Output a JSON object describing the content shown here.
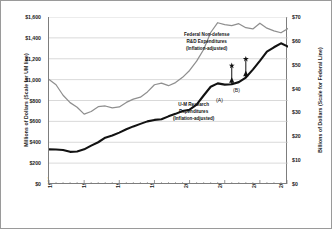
{
  "chart_data": {
    "type": "line",
    "title": "",
    "xlabel": "",
    "ylabel": "Millions of Dollars (Scale for UM line)",
    "ylabel_right": "Billions of Dollars (Scale for Federal Line)",
    "grid": true,
    "legend_position": "inline-annotation",
    "xlim": [
      1980,
      2014
    ],
    "ylim": [
      0,
      1600
    ],
    "ylim_right": [
      0,
      70
    ],
    "x_ticks": [
      "1980",
      "1985",
      "1990",
      "1995",
      "2000",
      "2005",
      "2010",
      "2014"
    ],
    "x_tick_values": [
      1980,
      1985,
      1990,
      1995,
      2000,
      2005,
      2010,
      2014
    ],
    "y_ticks_left": [
      "$0",
      "$200",
      "$400",
      "$600",
      "$800",
      "$1,000",
      "$1,200",
      "$1,400",
      "$1,600"
    ],
    "y_tick_values_left": [
      0,
      200,
      400,
      600,
      800,
      1000,
      1200,
      1400,
      1600
    ],
    "y_ticks_right": [
      "$0",
      "$10",
      "$20",
      "$30",
      "$40",
      "$50",
      "$60",
      "$70"
    ],
    "y_tick_values_right": [
      0,
      10,
      20,
      30,
      40,
      50,
      60,
      70
    ],
    "x": [
      1980,
      1981,
      1982,
      1983,
      1984,
      1985,
      1986,
      1987,
      1988,
      1989,
      1990,
      1991,
      1992,
      1993,
      1994,
      1995,
      1996,
      1997,
      1998,
      1999,
      2000,
      2001,
      2002,
      2003,
      2004,
      2005,
      2006,
      2007,
      2008,
      2009,
      2010,
      2011,
      2012,
      2013,
      2014
    ],
    "series": [
      {
        "name": "Federal Non-defense R&D Expenditures (Inflation-adjusted)",
        "axis": "right",
        "units": "Billions of Dollars",
        "color": "#8f8f8f",
        "values": [
          43.8,
          41.6,
          37.2,
          34.1,
          32.2,
          29.3,
          30.4,
          32.4,
          32.7,
          31.9,
          32.3,
          34.2,
          35.6,
          36.4,
          38.6,
          41.6,
          42.3,
          41.2,
          42.5,
          44.7,
          47.6,
          51.5,
          56.4,
          63.5,
          67.6,
          66.8,
          66.4,
          67.2,
          65.5,
          65.0,
          67.4,
          65.3,
          64.2,
          63.4,
          65.2
        ]
      },
      {
        "name": "U-M Research Expenditures (Inflation-adjusted)",
        "axis": "left",
        "units": "Millions of Dollars",
        "color": "#121212",
        "values": [
          332,
          330,
          326,
          308,
          312,
          332,
          368,
          400,
          444,
          464,
          492,
          524,
          552,
          576,
          600,
          614,
          620,
          648,
          672,
          700,
          712,
          760,
          848,
          932,
          964,
          952,
          956,
          976,
          1020,
          1096,
          1180,
          1268,
          1310,
          1348,
          1316
        ]
      }
    ],
    "annotations": [
      {
        "name": "federal-series-label",
        "lines": [
          "Federal Non-defense",
          "R&D Expenditures",
          "(Inflation-adjusted)"
        ]
      },
      {
        "name": "um-series-label",
        "lines": [
          "U-M Research",
          "Expenditures",
          "(Inflation-adjusted)"
        ]
      },
      {
        "name": "callout-a",
        "text": "(A)",
        "x_value": 2006,
        "y_value": 956
      },
      {
        "name": "callout-b",
        "text": "(B)",
        "x_value": 2008,
        "y_value": 1020
      }
    ]
  }
}
